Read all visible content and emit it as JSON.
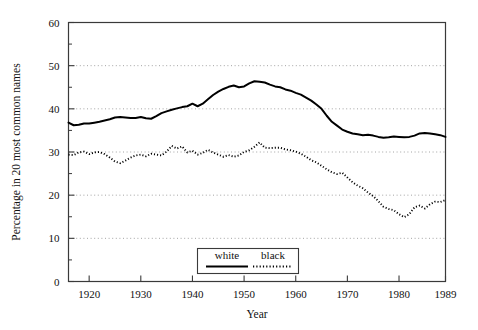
{
  "chart_data": {
    "type": "line",
    "title": "",
    "xlabel": "Year",
    "ylabel": "Percentage in 20 most common names",
    "xlim": [
      1916,
      1989
    ],
    "ylim": [
      0,
      60
    ],
    "grid": true,
    "grid_axis": "y",
    "grid_style": "dotted",
    "legend_position": "bottom-center",
    "xticks": [
      1920,
      1930,
      1940,
      1950,
      1960,
      1970,
      1980,
      1989
    ],
    "xtick_labels": [
      "1920",
      "1930",
      "1940",
      "1950",
      "1960",
      "1970",
      "1980",
      "1989"
    ],
    "yticks": [
      0,
      10,
      20,
      30,
      40,
      50,
      60
    ],
    "ytick_labels": [
      "0",
      "10",
      "20",
      "30",
      "40",
      "50",
      "60"
    ],
    "yminor_ticks": [
      5,
      15,
      25,
      35,
      45,
      55
    ],
    "x": [
      1916,
      1917,
      1918,
      1919,
      1920,
      1921,
      1922,
      1923,
      1924,
      1925,
      1926,
      1927,
      1928,
      1929,
      1930,
      1931,
      1932,
      1933,
      1934,
      1935,
      1936,
      1937,
      1938,
      1939,
      1940,
      1941,
      1942,
      1943,
      1944,
      1945,
      1946,
      1947,
      1948,
      1949,
      1950,
      1951,
      1952,
      1953,
      1954,
      1955,
      1956,
      1957,
      1958,
      1959,
      1960,
      1961,
      1962,
      1963,
      1964,
      1965,
      1966,
      1967,
      1968,
      1969,
      1970,
      1971,
      1972,
      1973,
      1974,
      1975,
      1976,
      1977,
      1978,
      1979,
      1980,
      1981,
      1982,
      1983,
      1984,
      1985,
      1986,
      1987,
      1988,
      1989
    ],
    "series": [
      {
        "name": "white",
        "style": "solid",
        "color": "#000000",
        "values": [
          36.8,
          36.2,
          36.3,
          36.6,
          36.6,
          36.8,
          37.0,
          37.3,
          37.6,
          38.0,
          38.1,
          38.0,
          37.9,
          37.9,
          38.1,
          37.8,
          37.7,
          38.3,
          39.0,
          39.4,
          39.8,
          40.1,
          40.4,
          40.6,
          41.2,
          40.6,
          41.2,
          42.2,
          43.2,
          44.0,
          44.6,
          45.1,
          45.4,
          45.0,
          45.2,
          45.9,
          46.4,
          46.3,
          46.1,
          45.6,
          45.2,
          45.0,
          44.5,
          44.2,
          43.7,
          43.3,
          42.6,
          41.9,
          41.0,
          40.0,
          38.4,
          37.0,
          36.1,
          35.2,
          34.7,
          34.3,
          34.1,
          33.9,
          34.0,
          33.8,
          33.5,
          33.3,
          33.4,
          33.6,
          33.5,
          33.4,
          33.5,
          33.8,
          34.3,
          34.4,
          34.3,
          34.1,
          33.9,
          33.5
        ]
      },
      {
        "name": "black",
        "style": "dotted",
        "color": "#000000",
        "values": [
          29.4,
          29.3,
          29.9,
          30.1,
          29.5,
          29.9,
          30.0,
          29.5,
          28.7,
          27.8,
          27.4,
          28.0,
          28.7,
          29.2,
          29.4,
          29.0,
          29.6,
          29.4,
          29.2,
          30.1,
          31.4,
          30.8,
          31.3,
          29.9,
          30.3,
          29.4,
          29.8,
          30.5,
          29.9,
          29.4,
          28.9,
          29.3,
          28.9,
          29.2,
          30.0,
          30.4,
          31.2,
          32.2,
          31.0,
          30.9,
          31.0,
          31.0,
          30.6,
          30.4,
          30.1,
          29.6,
          28.9,
          28.1,
          27.6,
          26.8,
          26.0,
          25.3,
          24.9,
          25.2,
          24.1,
          23.0,
          22.2,
          21.6,
          20.6,
          19.8,
          18.6,
          17.3,
          16.8,
          16.5,
          15.6,
          14.9,
          15.6,
          17.2,
          17.6,
          16.9,
          17.9,
          18.5,
          18.4,
          18.9
        ]
      }
    ]
  },
  "legend": {
    "items": [
      {
        "label": "white",
        "style": "solid"
      },
      {
        "label": "black",
        "style": "dotted"
      }
    ]
  }
}
